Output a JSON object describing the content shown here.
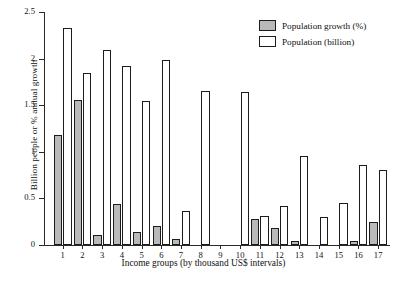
{
  "chart_data": {
    "type": "bar",
    "title": "",
    "xlabel": "Income groups (by thousand US$ intervals)",
    "ylabel": "Billion people or % annual growth",
    "categories": [
      "1",
      "2",
      "3",
      "4",
      "5",
      "6",
      "7",
      "8",
      "9",
      "10",
      "11",
      "12",
      "13",
      "14",
      "15",
      "16",
      "17"
    ],
    "ylim": [
      0,
      2.5
    ],
    "yticks": [
      "0",
      "0.5",
      "1",
      "1.5",
      "2",
      "2.5"
    ],
    "ytick_values": [
      0,
      0.5,
      1,
      1.5,
      2,
      2.5
    ],
    "grid": false,
    "legend_position": "top-right",
    "series": [
      {
        "name": "Population growth (%)",
        "color": "#b9b9b9",
        "values": [
          1.18,
          1.56,
          0.11,
          0.44,
          0.14,
          0.2,
          0.06,
          0,
          0,
          0,
          0.28,
          0.18,
          0.04,
          0,
          0,
          0.04,
          0.25
        ]
      },
      {
        "name": "Population (billion)",
        "color": "#ffffff",
        "values": [
          2.33,
          1.85,
          2.09,
          1.92,
          1.54,
          1.99,
          0.37,
          1.65,
          0,
          1.64,
          0.31,
          0.42,
          0.95,
          0.3,
          0.45,
          0.86,
          0.8
        ]
      }
    ]
  },
  "legend": {
    "items": [
      {
        "label": "Population growth (%)",
        "swatch": "growth"
      },
      {
        "label": "Population (billion)",
        "swatch": "population"
      }
    ]
  }
}
